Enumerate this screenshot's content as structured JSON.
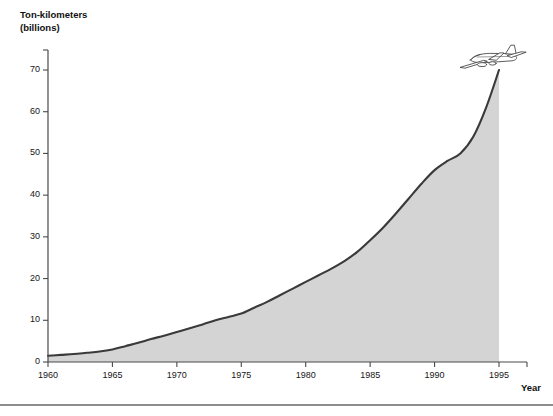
{
  "chart_data": {
    "type": "area",
    "title": "",
    "ylabel_line1": "Ton-kilometers",
    "ylabel_line2": "(billions)",
    "xlabel": "Year",
    "x": [
      1960,
      1961,
      1962,
      1963,
      1964,
      1965,
      1966,
      1967,
      1968,
      1969,
      1970,
      1971,
      1972,
      1973,
      1974,
      1975,
      1976,
      1977,
      1978,
      1979,
      1980,
      1981,
      1982,
      1983,
      1984,
      1985,
      1986,
      1987,
      1988,
      1989,
      1990,
      1991,
      1992,
      1993,
      1994,
      1995
    ],
    "values": [
      1.5,
      1.7,
      1.9,
      2.2,
      2.5,
      3.0,
      3.8,
      4.6,
      5.5,
      6.3,
      7.2,
      8.1,
      9.0,
      10.0,
      10.8,
      11.6,
      13.0,
      14.4,
      16.0,
      17.6,
      19.2,
      20.8,
      22.4,
      24.2,
      26.4,
      29.2,
      32.2,
      35.6,
      39.2,
      42.8,
      46.0,
      48.2,
      50.0,
      54.0,
      61.0,
      70.0
    ],
    "series": [
      {
        "name": "Air freight ton-kilometers",
        "values": [
          1.5,
          1.7,
          1.9,
          2.2,
          2.5,
          3.0,
          3.8,
          4.6,
          5.5,
          6.3,
          7.2,
          8.1,
          9.0,
          10.0,
          10.8,
          11.6,
          13.0,
          14.4,
          16.0,
          17.6,
          19.2,
          20.8,
          22.4,
          24.2,
          26.4,
          29.2,
          32.2,
          35.6,
          39.2,
          42.8,
          46.0,
          48.2,
          50.0,
          54.0,
          61.0,
          70.0
        ]
      }
    ],
    "xlim": [
      1960,
      1995
    ],
    "ylim": [
      0,
      75
    ],
    "ytick_labels": [
      "0",
      "10",
      "20",
      "30",
      "40",
      "50",
      "60",
      "70"
    ],
    "ytick_values": [
      0,
      10,
      20,
      30,
      40,
      50,
      60,
      70
    ],
    "xtick_labels": [
      "1960",
      "1965",
      "1970",
      "1975",
      "1980",
      "1985",
      "1990",
      "1995"
    ],
    "xtick_values": [
      1960,
      1965,
      1970,
      1975,
      1980,
      1985,
      1990,
      1995
    ],
    "grid": false,
    "legend": null,
    "annotations": [
      {
        "name": "airplane-icon",
        "x": 1995,
        "y": 70,
        "label": "airplane"
      }
    ],
    "colors": {
      "area_fill": "#d4d4d4",
      "line": "#3a3a3a",
      "axis": "#4a4a4a",
      "text": "#161616",
      "rule": "#8d8d8d"
    }
  }
}
